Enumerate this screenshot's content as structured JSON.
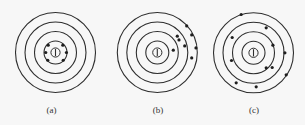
{
  "figure": {
    "colors": {
      "background": "#f7f7f7",
      "ink": "#2e2e2e",
      "hit": "#1e1e1e"
    },
    "targets": [
      {
        "id": "a",
        "label": "(a)",
        "pattern": "tight cluster around bullseye",
        "hits": [
          {
            "angle_deg": -45,
            "distance_rings": 0.9
          },
          {
            "angle_deg": -135,
            "distance_rings": 0.9
          },
          {
            "angle_deg": 180,
            "distance_rings": 0.85
          },
          {
            "angle_deg": 0,
            "distance_rings": 0.95
          },
          {
            "angle_deg": 135,
            "distance_rings": 0.95
          },
          {
            "angle_deg": 45,
            "distance_rings": 0.95
          }
        ]
      },
      {
        "id": "b",
        "label": "(b)",
        "pattern": "tight cluster offset to upper right",
        "hits": [
          {
            "dx": 29.4,
            "dy": -26.6
          },
          {
            "dx": 34.4,
            "dy": -17.6
          },
          {
            "dx": 20.0,
            "dy": -16.3
          },
          {
            "dx": 21.7,
            "dy": -12.6
          },
          {
            "dx": 27.4,
            "dy": -6.6
          },
          {
            "dx": 38.7,
            "dy": -4.6
          },
          {
            "dx": 16.0,
            "dy": -2.3
          },
          {
            "dx": 34.4,
            "dy": 5.4
          }
        ]
      },
      {
        "id": "c",
        "label": "(c)",
        "pattern": "scattered across rings",
        "hits": [
          {
            "dx": -12.3,
            "dy": -38.3
          },
          {
            "dx": 12.7,
            "dy": -25.0
          },
          {
            "dx": -21.3,
            "dy": -15.3
          },
          {
            "dx": 19.4,
            "dy": -7.6
          },
          {
            "dx": 31.4,
            "dy": 0.0
          },
          {
            "dx": -22.0,
            "dy": 7.7
          },
          {
            "dx": 12.7,
            "dy": 15.0
          },
          {
            "dx": 18.7,
            "dy": 14.7
          },
          {
            "dx": 32.7,
            "dy": 22.0
          },
          {
            "dx": -17.3,
            "dy": 30.0
          },
          {
            "dx": 2.7,
            "dy": 34.0
          }
        ]
      }
    ]
  }
}
